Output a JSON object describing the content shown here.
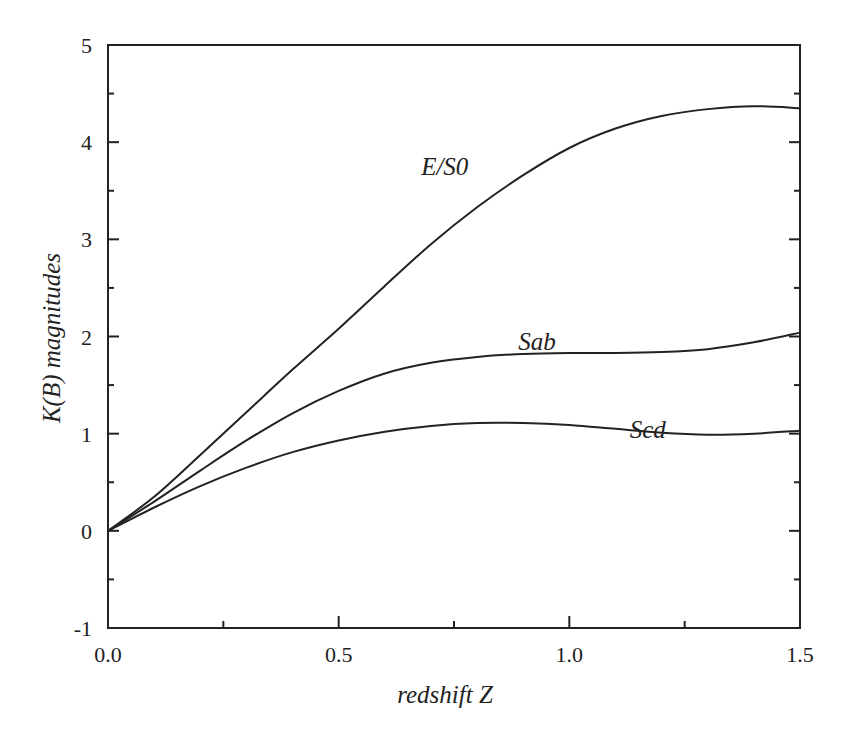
{
  "chart_data": {
    "type": "line",
    "title": "",
    "xlabel": "redshift  Z",
    "ylabel": "K(B)  magnitudes",
    "xlim": [
      0.0,
      1.5
    ],
    "ylim": [
      -1,
      5
    ],
    "x_ticks": [
      "0.0",
      "0.5",
      "1.0",
      "1.5"
    ],
    "y_ticks": [
      "-1",
      "0",
      "1",
      "2",
      "3",
      "4",
      "5"
    ],
    "grid": false,
    "legend": "inline labels",
    "x": [
      0.0,
      0.1,
      0.2,
      0.3,
      0.4,
      0.5,
      0.6,
      0.7,
      0.8,
      0.9,
      1.0,
      1.1,
      1.2,
      1.3,
      1.4,
      1.5
    ],
    "series": [
      {
        "name": "E/S0",
        "values": [
          0.0,
          0.35,
          0.78,
          1.22,
          1.66,
          2.08,
          2.52,
          2.95,
          3.33,
          3.66,
          3.94,
          4.14,
          4.27,
          4.34,
          4.37,
          4.35
        ]
      },
      {
        "name": "Sab",
        "values": [
          0.0,
          0.3,
          0.62,
          0.93,
          1.21,
          1.44,
          1.62,
          1.73,
          1.79,
          1.82,
          1.83,
          1.83,
          1.84,
          1.87,
          1.94,
          2.04
        ]
      },
      {
        "name": "Scd",
        "values": [
          0.0,
          0.24,
          0.46,
          0.65,
          0.81,
          0.93,
          1.02,
          1.08,
          1.11,
          1.11,
          1.09,
          1.05,
          1.01,
          0.99,
          1.0,
          1.03
        ]
      }
    ],
    "annotations": [
      {
        "text": "E/S0",
        "x": 0.73,
        "y": 3.75
      },
      {
        "text": "Sab",
        "x": 0.93,
        "y": 1.95
      },
      {
        "text": "Scd",
        "x": 1.17,
        "y": 1.05
      }
    ]
  }
}
